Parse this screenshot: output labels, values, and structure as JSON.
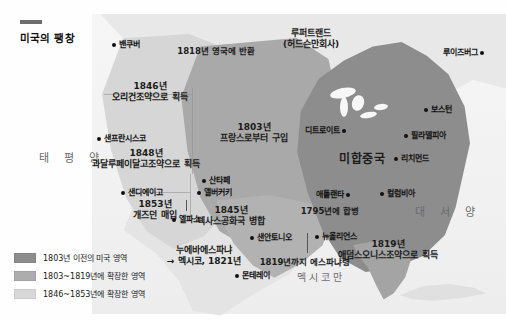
{
  "title": "미국의 팽창",
  "oceans": {
    "pacific": "태 평 양",
    "atlantic": "대 서 양",
    "gulf": "멕시코만"
  },
  "country_label": "미합중국",
  "regions": [
    {
      "name": "rupert-land",
      "line1": "루퍼트랜드",
      "line2": "(허드슨만회사)",
      "x": 311,
      "y": 28
    },
    {
      "name": "returned-to-britain-1818",
      "line1": "1818년 영국에 반환",
      "line2": "",
      "x": 216,
      "y": 46
    },
    {
      "name": "oregon-treaty-1846",
      "line1": "1846년",
      "line2": "오리건조약으로 획득",
      "x": 150,
      "y": 81
    },
    {
      "name": "louisiana-purchase-1803",
      "line1": "1803년",
      "line2": "프랑스로부터 구입",
      "x": 254,
      "y": 122
    },
    {
      "name": "guadalupe-hidalgo-1848",
      "line1": "1848년",
      "line2": "과달루페이달고조약으로 획득",
      "x": 146,
      "y": 148
    },
    {
      "name": "gadsden-purchase-1853",
      "line1": "1853년",
      "line2": "개즈던 매입",
      "x": 155,
      "y": 199
    },
    {
      "name": "texas-annexation-1845",
      "line1": "1845년",
      "line2": "텍사스공화국 병합",
      "x": 231,
      "y": 205
    },
    {
      "name": "new-spain-mexico-1821",
      "line1": "누에바에스파냐",
      "line2": "→ 멕시코, 1821년",
      "x": 204,
      "y": 245
    },
    {
      "name": "annexed-1795",
      "line1": "1795년에 합병",
      "line2": "",
      "x": 330,
      "y": 206
    },
    {
      "name": "adams-onis-treaty-1819",
      "line1": "1819년",
      "line2": "애덤스오니스조약으로 획득",
      "x": 388,
      "y": 239
    },
    {
      "name": "spanish-until-1819",
      "line1": "1819년까지 에스파냐령",
      "line2": "",
      "x": 305,
      "y": 257
    }
  ],
  "cities": [
    {
      "name": "vancouver",
      "label": "밴쿠버",
      "x": 110,
      "y": 38,
      "side": "left"
    },
    {
      "name": "san-francisco",
      "label": "샌프란시스코",
      "x": 95,
      "y": 132,
      "side": "left"
    },
    {
      "name": "san-diego",
      "label": "샌디에이고",
      "x": 119,
      "y": 186,
      "side": "left"
    },
    {
      "name": "el-paso",
      "label": "엘파소",
      "x": 185,
      "y": 213,
      "side": "center"
    },
    {
      "name": "santa-fe",
      "label": "산타페",
      "x": 200,
      "y": 174,
      "side": "left"
    },
    {
      "name": "albuquerque",
      "label": "앨버커키",
      "x": 195,
      "y": 186,
      "side": "left"
    },
    {
      "name": "san-antonio",
      "label": "샌안토니오",
      "x": 248,
      "y": 231,
      "side": "left"
    },
    {
      "name": "monterrey",
      "label": "몬테레이",
      "x": 233,
      "y": 269,
      "side": "left"
    },
    {
      "name": "new-orleans",
      "label": "뉴올리언스",
      "x": 313,
      "y": 230,
      "side": "left"
    },
    {
      "name": "atlanta",
      "label": "애틀랜타",
      "x": 352,
      "y": 188,
      "side": "right"
    },
    {
      "name": "columbia",
      "label": "컬럼비아",
      "x": 378,
      "y": 187,
      "side": "left"
    },
    {
      "name": "richmond",
      "label": "리치먼드",
      "x": 392,
      "y": 152,
      "side": "left"
    },
    {
      "name": "philadelphia",
      "label": "필라델피아",
      "x": 402,
      "y": 129,
      "side": "left"
    },
    {
      "name": "boston",
      "label": "보스턴",
      "x": 422,
      "y": 103,
      "side": "left"
    },
    {
      "name": "detroit",
      "label": "디트로이트",
      "x": 348,
      "y": 124,
      "side": "right"
    },
    {
      "name": "louisbourg",
      "label": "루이즈버그",
      "x": 486,
      "y": 46,
      "side": "right"
    }
  ],
  "legend": [
    {
      "name": "legend-pre-1803",
      "color": "#8d8d8d",
      "text": "1803년 이전의 미국 영역"
    },
    {
      "name": "legend-1803-1819",
      "color": "#adadad",
      "text": "1803~1819년에 확장한 영역"
    },
    {
      "name": "legend-1846-1853",
      "color": "#d8d8d8",
      "text": "1846~1853년에 확장한 영역"
    }
  ],
  "chart_data": {
    "type": "map",
    "title": "미국의 팽창",
    "legend_position": "bottom-left",
    "series": [
      {
        "name": "1803년 이전의 미국 영역",
        "color": "#8d8d8d"
      },
      {
        "name": "1803~1819년에 확장한 영역",
        "color": "#adadad"
      },
      {
        "name": "1846~1853년에 확장한 영역",
        "color": "#d8d8d8"
      }
    ],
    "annotations": [
      "1818년 영국에 반환",
      "1846년 오리건조약으로 획득",
      "1803년 프랑스로부터 구입",
      "1848년 과달루페이달고조약으로 획득",
      "1853년 개즈던 매입",
      "1845년 텍사스공화국 병합",
      "1795년에 합병",
      "1819년 애덤스오니스조약으로 획득",
      "1819년까지 에스파냐령",
      "누에바에스파냐 → 멕시코, 1821년",
      "루퍼트랜드 (허드슨만회사)"
    ]
  }
}
